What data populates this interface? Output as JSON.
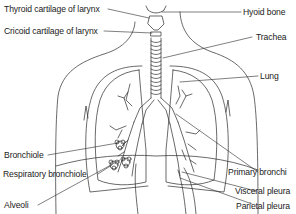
{
  "diagram": {
    "colors": {
      "line": "#2a2a2a",
      "background": "#ffffff",
      "text": "#1a1a1a"
    },
    "labels": {
      "thyroid_cartilage": "Thyroid cartilage of larynx",
      "cricoid_cartilage": "Cricoid cartilage of larynx",
      "hyoid_bone": "Hyoid bone",
      "trachea": "Trachea",
      "lung": "Lung",
      "bronchiole": "Bronchiole",
      "respiratory_bronchiole": "Respiratory bronchiole",
      "alveoli": "Alveoli",
      "primary_bronchi": "Primary bronchi",
      "visceral_pleura": "Visceral pleura",
      "parietal_pleura": "Parietal pleura"
    }
  }
}
